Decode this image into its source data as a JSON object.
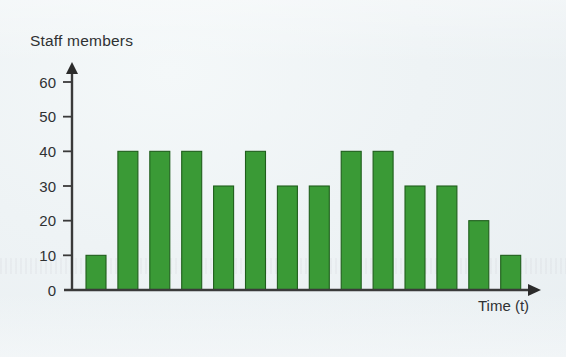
{
  "chart_data": {
    "type": "bar",
    "title": "",
    "ylabel": "Staff members",
    "xlabel": "Time (t)",
    "categories": [
      "1",
      "2",
      "3",
      "4",
      "5",
      "6",
      "7",
      "8",
      "9",
      "10",
      "11",
      "12",
      "13",
      "14"
    ],
    "values": [
      10,
      40,
      40,
      40,
      30,
      40,
      30,
      30,
      40,
      40,
      30,
      30,
      20,
      10
    ],
    "ylim": [
      0,
      60
    ],
    "y_ticks": [
      0,
      10,
      20,
      30,
      40,
      50,
      60
    ],
    "y_tick_labels": [
      "0",
      "10",
      "20",
      "30",
      "40",
      "50",
      "60"
    ],
    "x_ticks": [],
    "x_tick_labels": [],
    "grid": false,
    "legend": false,
    "legend_position": "none",
    "bar_color": "#3A9A36",
    "bar_edge_color": "#1F5E1C",
    "axis_color": "#3A3A3A",
    "background_color": "#EFF4F6",
    "text_color": "#2F3133",
    "y_axis_has_arrow": true,
    "x_axis_has_arrow": true
  },
  "figure": {
    "y_axis_title": "Staff members",
    "x_axis_title": "Time (t)"
  }
}
